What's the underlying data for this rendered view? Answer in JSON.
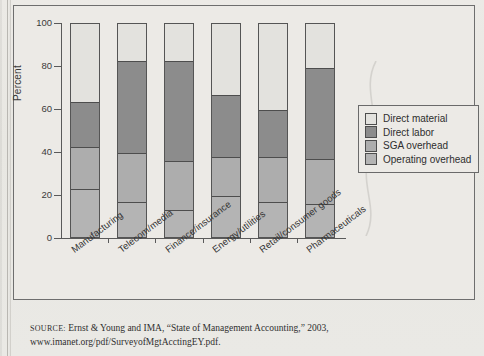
{
  "figure": {
    "ylabel": "Percent",
    "yticks": [
      "0",
      "20",
      "40",
      "60",
      "80",
      "100"
    ]
  },
  "legend": {
    "items": [
      {
        "label": "Direct material",
        "color": "#e3e2de"
      },
      {
        "label": "Direct labor",
        "color": "#8c8c8c"
      },
      {
        "label": "SGA overhead",
        "color": "#adadad"
      },
      {
        "label": "Operating overhead",
        "color": "#b4b4b4"
      }
    ]
  },
  "source": {
    "label": "SOURCE:",
    "line1": "Ernst & Young and IMA, “State of Management Accounting,” 2003,",
    "line2": "www.imanet.org/pdf/SurveyofMgtAcctingEY.pdf."
  },
  "chart_data": {
    "type": "bar",
    "subtype": "stacked-bar",
    "title": "",
    "xlabel": "",
    "ylabel": "Percent",
    "ylim": [
      0,
      100
    ],
    "yticks": [
      0,
      20,
      40,
      60,
      80,
      100
    ],
    "grid": false,
    "legend_position": "right",
    "categories": [
      "Manufacturing",
      "Telecom/media",
      "Finance/insurance",
      "Energy/utilities",
      "Retail/consumer goods",
      "Pharmaceuticals"
    ],
    "series": [
      {
        "name": "Operating overhead",
        "color": "#b4b4b4",
        "values": [
          22,
          16,
          12,
          19,
          16,
          15
        ]
      },
      {
        "name": "SGA overhead",
        "color": "#adadad",
        "values": [
          20,
          23,
          23,
          18,
          21,
          21
        ]
      },
      {
        "name": "Direct labor",
        "color": "#8c8c8c",
        "values": [
          21,
          43,
          47,
          29,
          22,
          43
        ]
      },
      {
        "name": "Direct material",
        "color": "#e3e2de",
        "values": [
          37,
          18,
          18,
          34,
          41,
          21
        ]
      }
    ],
    "stack_order_bottom_to_top": [
      "Operating overhead",
      "SGA overhead",
      "Direct labor",
      "Direct material"
    ],
    "cumulative_boundaries": [
      {
        "category": "Manufacturing",
        "b1": 22,
        "b2": 42,
        "b3": 63,
        "b4": 100
      },
      {
        "category": "Telecom/media",
        "b1": 16,
        "b2": 39,
        "b3": 82,
        "b4": 100
      },
      {
        "category": "Finance/insurance",
        "b1": 12,
        "b2": 35,
        "b3": 82.5,
        "b4": 100
      },
      {
        "category": "Energy/utilities",
        "b1": 19,
        "b2": 37,
        "b3": 66,
        "b4": 100
      },
      {
        "category": "Retail/consumer goods",
        "b1": 16,
        "b2": 37,
        "b3": 59,
        "b4": 100
      },
      {
        "category": "Pharmaceuticals",
        "b1": 15,
        "b2": 36,
        "b3": 79.5,
        "b4": 100
      }
    ]
  }
}
